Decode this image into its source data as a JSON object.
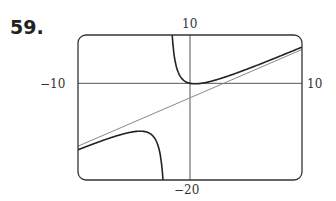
{
  "problem_number": "59.",
  "chart_data": {
    "type": "line",
    "title": "",
    "xlim": [
      -10,
      10
    ],
    "ylim": [
      -20,
      10
    ],
    "tick_labels": {
      "x_left": "-10",
      "x_right": "10",
      "y_top": "10",
      "y_bottom": "-20"
    },
    "series": [
      {
        "name": "function",
        "description": "rational function with vertical asymptote near x = -2 and slant asymptote",
        "formula_approx": "y = x - 3 + 6/(x+2)",
        "color": "#222222"
      },
      {
        "name": "slant asymptote",
        "formula_approx": "y = x - 3",
        "color": "#888888"
      }
    ],
    "grid": false
  },
  "labels": {
    "x_left": "−10",
    "x_right": "10",
    "y_top": "10",
    "y_bottom": "−20"
  }
}
